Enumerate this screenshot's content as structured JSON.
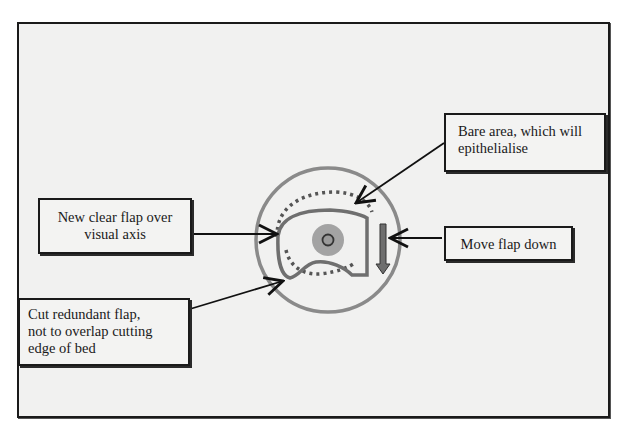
{
  "diagram": {
    "background_color": "#f1f1f0",
    "frame_border_color": "#1a1a1a",
    "eye": {
      "cornea_ring_color": "#8a8a8a",
      "pupil_color": "#9e9e9e",
      "flap_outline_color": "#6f6f6f"
    },
    "labels": {
      "new_flap": "New clear flap over visual axis",
      "cut_flap": "Cut redundant flap, not to overlap cutting edge of bed",
      "bare_area": "Bare area, which will epithelialise",
      "move_flap": "Move flap down"
    },
    "label_lines": {
      "new_flap": [
        "New clear flap over",
        "visual axis"
      ],
      "cut_flap": [
        "Cut redundant flap,",
        "not to overlap cutting",
        "edge of bed"
      ],
      "bare_area": [
        "Bare area, which will",
        "epithelialise"
      ],
      "move_flap": [
        "Move flap down"
      ]
    }
  }
}
